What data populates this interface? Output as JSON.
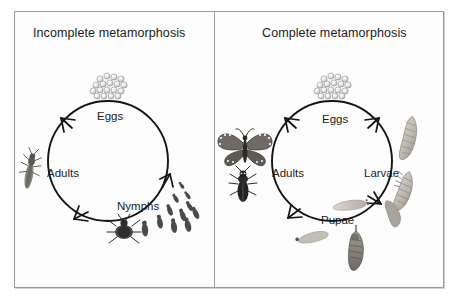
{
  "figure": {
    "type": "diagram",
    "background_color": "#ffffff",
    "frame_border_color": "#9a9a9a",
    "ink_color": "#1b1b1b"
  },
  "panels": [
    {
      "id": "incomplete",
      "title": "Incomplete metamorphosis",
      "cycle": {
        "direction": "counter-clockwise",
        "center": {
          "x": 108,
          "y": 161
        },
        "radius": 60,
        "stages": [
          {
            "label": "Eggs",
            "label_x": 97,
            "label_y": 110,
            "illustration": "egg-cluster",
            "art_x": 112,
            "art_y": 83
          },
          {
            "label": "Nymphs",
            "label_x": 117,
            "label_y": 200,
            "illustration": "nymph-series",
            "art_x": 170,
            "art_y": 210
          },
          {
            "label": "Adults",
            "label_x": 47,
            "label_y": 167,
            "illustration": "adult-insects",
            "art_x": 32,
            "art_y": 170
          }
        ]
      }
    },
    {
      "id": "complete",
      "title": "Complete metamorphosis",
      "cycle": {
        "direction": "clockwise",
        "center": {
          "x": 332,
          "y": 161
        },
        "radius": 60,
        "stages": [
          {
            "label": "Eggs",
            "label_x": 322,
            "label_y": 113,
            "illustration": "egg-cluster",
            "art_x": 337,
            "art_y": 83
          },
          {
            "label": "Larvae",
            "label_x": 364,
            "label_y": 167,
            "illustration": "grub-larvae",
            "art_x": 412,
            "art_y": 160
          },
          {
            "label": "Pupae",
            "label_x": 321,
            "label_y": 214,
            "illustration": "pupa-cocoon",
            "art_x": 355,
            "art_y": 226
          },
          {
            "label": "Adults",
            "label_x": 272,
            "label_y": 167,
            "illustration": "butterfly-beetle",
            "art_x": 242,
            "art_y": 165
          }
        ]
      }
    }
  ],
  "illustrations": {
    "egg_count": 18,
    "nymph_count": 12,
    "larvae_count": 3,
    "pupae_count": 4,
    "adult_left_count": 2,
    "adult_right_count": 2,
    "egg_fill": "#d8d8d8",
    "nymph_fill": "#555555",
    "larva_fill": "#b9b5ac",
    "pupa_fill": "#8c8880",
    "adult_fill": "#3a3a3a"
  }
}
